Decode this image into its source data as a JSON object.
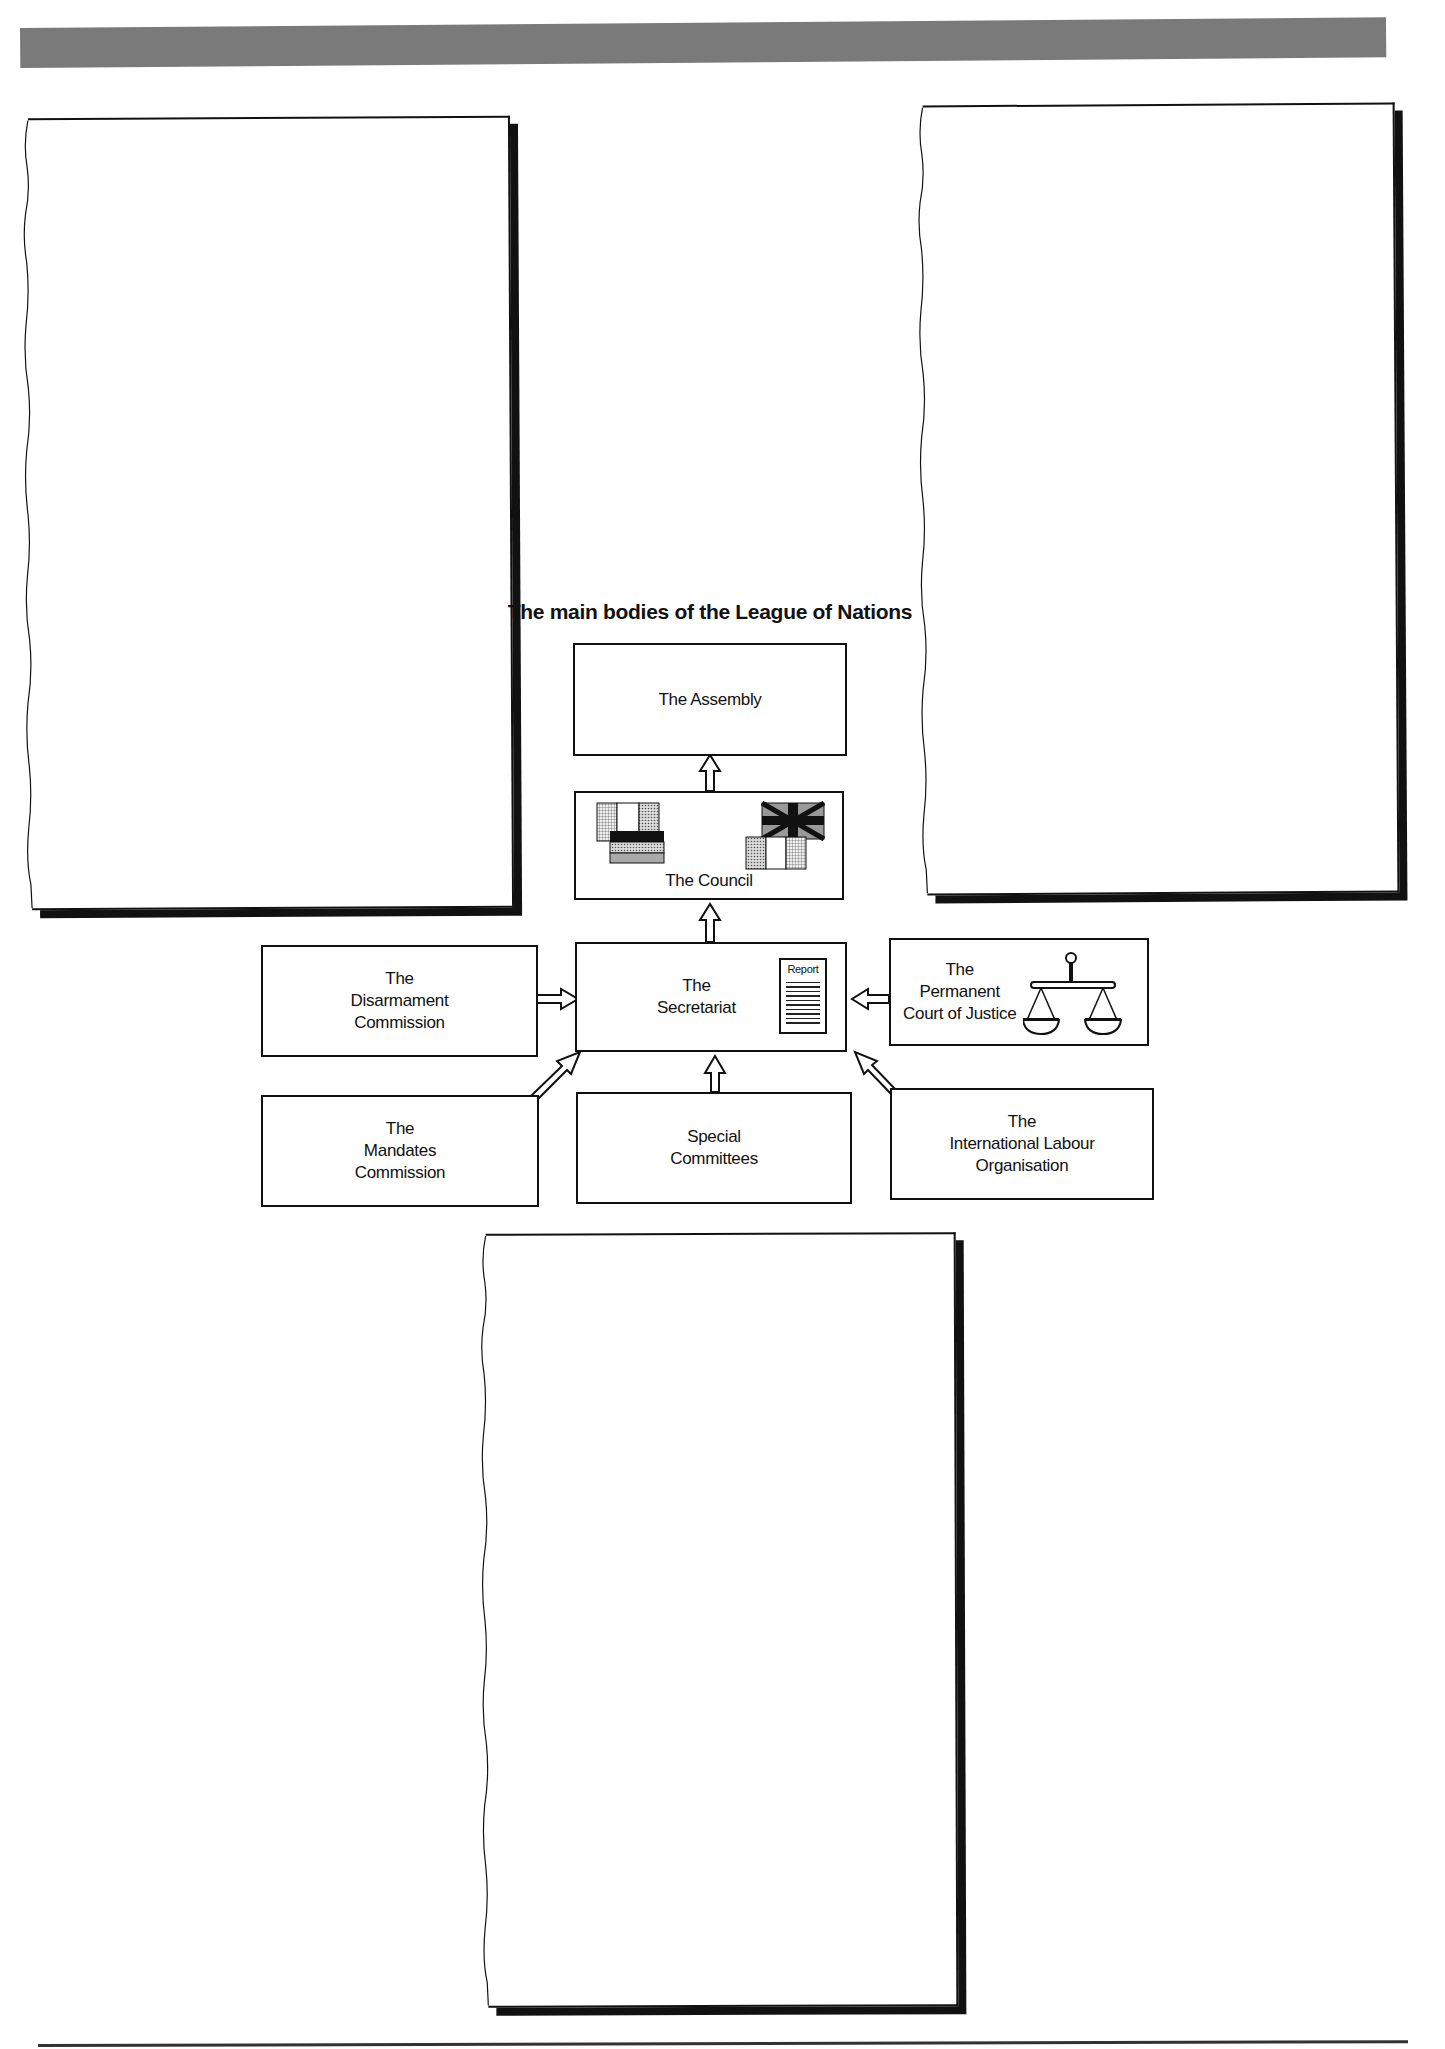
{
  "header": {
    "bar_color": "#7a7a7a"
  },
  "diagram": {
    "title": "The main bodies of the League of Nations",
    "nodes": {
      "assembly": {
        "label": "The Assembly"
      },
      "council": {
        "label": "The Council",
        "icons": [
          "flags-italy-germany",
          "flags-britain-france"
        ]
      },
      "secretariat": {
        "label": "The\nSecretariat",
        "report_label": "Report"
      },
      "disarmament": {
        "label": "The\nDisarmament\nCommission"
      },
      "court": {
        "label": "The\nPermanent\nCourt of Justice"
      },
      "mandates": {
        "label": "The\nMandates\nCommission"
      },
      "committees": {
        "label": "Special\nCommittees"
      },
      "ilo": {
        "label": "The\nInternational Labour\nOrganisation"
      }
    },
    "edges": [
      {
        "from": "council",
        "to": "assembly"
      },
      {
        "from": "secretariat",
        "to": "council"
      },
      {
        "from": "disarmament",
        "to": "secretariat"
      },
      {
        "from": "court",
        "to": "secretariat"
      },
      {
        "from": "mandates",
        "to": "secretariat"
      },
      {
        "from": "committees",
        "to": "secretariat"
      },
      {
        "from": "ilo",
        "to": "secretariat"
      }
    ]
  },
  "answer_panels": [
    {
      "position": "top-left",
      "text": ""
    },
    {
      "position": "top-right",
      "text": ""
    },
    {
      "position": "bottom-center",
      "text": ""
    }
  ]
}
